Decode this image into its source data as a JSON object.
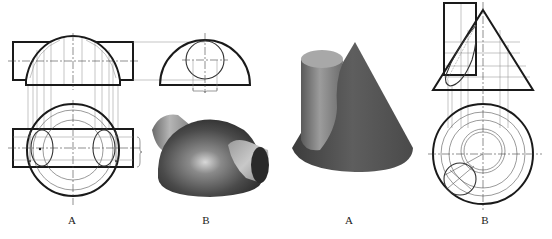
{
  "figure": {
    "panels": [
      {
        "id": "left-A",
        "label": "A",
        "content": "front and top orthographic views of a hemisphere intersected by a horizontal cylinder"
      },
      {
        "id": "left-B",
        "label": "B",
        "content": "side view of hemisphere with cylinder section and shaded 3D render"
      },
      {
        "id": "right-A",
        "label": "A",
        "content": "shaded 3D render of a cone intersected by a vertical cylinder"
      },
      {
        "id": "right-B",
        "label": "B",
        "content": "front and top orthographic views of cone-cylinder intersection"
      }
    ]
  },
  "labels": {
    "left_a": "A",
    "left_b": "B",
    "right_a": "A",
    "right_b": "B"
  },
  "colors": {
    "line": "#1a1a1a",
    "construction": "#777777",
    "shade_dark": "#3a3a3a",
    "shade_light": "#bdbdbd",
    "background": "#ffffff"
  }
}
